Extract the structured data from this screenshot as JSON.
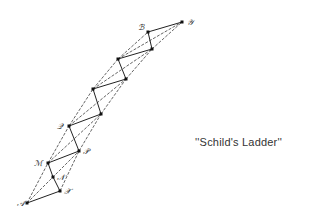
{
  "caption": "''Schild's Ladder''",
  "colors": {
    "line": "#222222",
    "point": "#111111",
    "background": "#ffffff"
  },
  "points": [
    {
      "id": "A",
      "label": "𝒜",
      "x": 27,
      "y": 203,
      "lx": 17,
      "ly": 206
    },
    {
      "id": "X",
      "label": "𝒳",
      "x": 60,
      "y": 191,
      "lx": 64,
      "ly": 194
    },
    {
      "id": "N",
      "label": "𝒩",
      "x": 53,
      "y": 177,
      "lx": 57,
      "ly": 180
    },
    {
      "id": "M",
      "label": "ℳ",
      "x": 48,
      "y": 163,
      "lx": 34,
      "ly": 166
    },
    {
      "id": "P",
      "label": "𝒫",
      "x": 79,
      "y": 151,
      "lx": 83,
      "ly": 154
    },
    {
      "id": "Q",
      "label": "𝒬",
      "x": 69,
      "y": 126,
      "lx": 57,
      "ly": 129
    },
    {
      "id": "R1",
      "label": "",
      "x": 101,
      "y": 114
    },
    {
      "id": "C2",
      "label": "",
      "x": 93,
      "y": 89
    },
    {
      "id": "R2",
      "label": "",
      "x": 126,
      "y": 79
    },
    {
      "id": "C3",
      "label": "",
      "x": 118,
      "y": 59
    },
    {
      "id": "R3",
      "label": "",
      "x": 152,
      "y": 49
    },
    {
      "id": "B",
      "label": "ℬ",
      "x": 148,
      "y": 32,
      "lx": 138,
      "ly": 30
    },
    {
      "id": "Y",
      "label": "𝒴",
      "x": 182,
      "y": 22,
      "lx": 187,
      "ly": 25
    }
  ],
  "solid_edges": [
    [
      "A",
      "X"
    ],
    [
      "X",
      "N"
    ],
    [
      "N",
      "M"
    ],
    [
      "M",
      "P"
    ],
    [
      "P",
      "Q"
    ],
    [
      "Q",
      "R1"
    ],
    [
      "R1",
      "C2"
    ],
    [
      "C2",
      "R2"
    ],
    [
      "R2",
      "C3"
    ],
    [
      "C3",
      "R3"
    ],
    [
      "R3",
      "B"
    ],
    [
      "B",
      "Y"
    ]
  ],
  "dashed_edges": [
    [
      "A",
      "M"
    ],
    [
      "M",
      "Q"
    ],
    [
      "Q",
      "C2"
    ],
    [
      "C2",
      "C3"
    ],
    [
      "C3",
      "B"
    ],
    [
      "A",
      "P"
    ],
    [
      "M",
      "R1"
    ],
    [
      "Q",
      "R2"
    ],
    [
      "C2",
      "R3"
    ],
    [
      "C3",
      "Y"
    ],
    [
      "X",
      "P"
    ],
    [
      "P",
      "R1"
    ],
    [
      "R1",
      "R2"
    ],
    [
      "R2",
      "R3"
    ],
    [
      "R3",
      "Y"
    ]
  ]
}
